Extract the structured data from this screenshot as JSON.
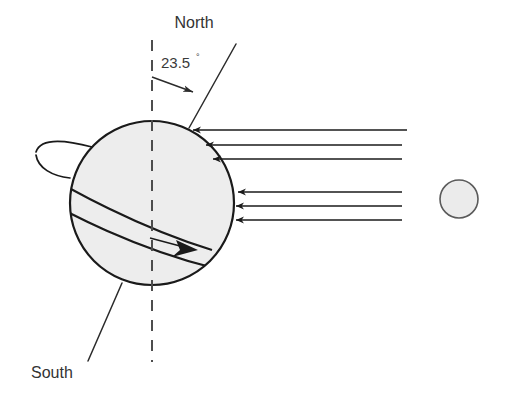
{
  "diagram": {
    "title_visible": false,
    "labels": {
      "north": "North",
      "south": "South",
      "tilt_angle": "23.5",
      "degree_symbol": "°"
    },
    "colors": {
      "background": "#ffffff",
      "outline": "#1a1a1a",
      "globe_fill": "#ededed",
      "sun_fill": "#ebebeb",
      "sun_outline": "#5a5a5a",
      "text": "#333333",
      "dashed_axis": "#4d4d4d",
      "ray": "#1a1a1a"
    },
    "earth": {
      "name": "earth-globe",
      "center_x": 152,
      "center_y": 203,
      "radius": 82
    },
    "sun": {
      "name": "sun-circle",
      "center_x": 459,
      "center_y": 199,
      "radius": 19
    },
    "rotation_axis": {
      "name": "tilted-rotation-axis",
      "north_end_x": 236,
      "north_end_y": 44,
      "south_end_x": 88,
      "south_end_y": 361,
      "tilt_degrees": 23.5
    },
    "vertical_reference": {
      "name": "vertical-dashed-reference",
      "x": 152,
      "top_y": 40,
      "bottom_y": 362,
      "dash_pattern": "11 9"
    },
    "angle_indicator": {
      "name": "tilt-angle-arrow",
      "from_x": 152,
      "from_y": 77,
      "to_x": 197,
      "to_y": 93
    },
    "equator_band": {
      "name": "equatorial-orbit-band",
      "description": "tilted ellipse band crossing the globe with direction arrow"
    },
    "rotation_arrow": {
      "name": "rotation-direction-arrow",
      "tip_x": 196,
      "tip_y": 249
    },
    "sun_rays": {
      "name": "sunlight-rays",
      "direction": "right-to-left",
      "count": 6,
      "upper_group": [
        {
          "y": 130,
          "x_start": 407,
          "x_end": 191
        },
        {
          "y": 144,
          "x_start": 402,
          "x_end": 204
        },
        {
          "y": 158,
          "x_start": 402,
          "x_end": 211
        }
      ],
      "lower_group": [
        {
          "y": 192,
          "x_start": 402,
          "x_end": 236
        },
        {
          "y": 206,
          "x_start": 402,
          "x_end": 234
        },
        {
          "y": 220,
          "x_start": 402,
          "x_end": 234
        }
      ]
    }
  }
}
